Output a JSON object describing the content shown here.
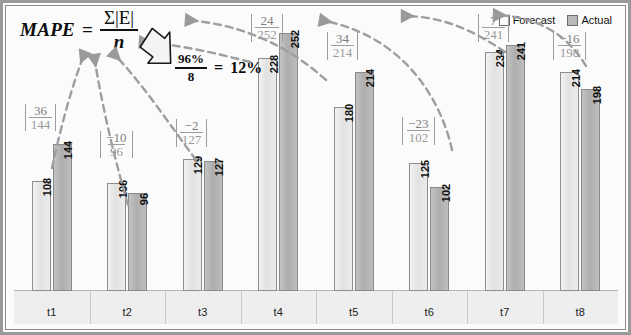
{
  "formula": {
    "name": "MAPE",
    "equals": "=",
    "numerator": "Σ|E|",
    "denominator": "n",
    "result_numerator": "96%",
    "result_denominator": "8",
    "result_equals": "=",
    "result_value": "12%"
  },
  "legend": {
    "items": [
      {
        "label": "Forecast",
        "swatch": "forecast-swatch",
        "color": "#fdfdfd"
      },
      {
        "label": "Actual",
        "swatch": "actual-swatch",
        "color": "#b9b9b9"
      }
    ]
  },
  "chart_data": {
    "type": "bar",
    "title": "",
    "xlabel": "",
    "ylabel": "",
    "ylim": [
      0,
      265
    ],
    "grid": false,
    "legend_position": "top-right",
    "categories": [
      "t1",
      "t2",
      "t3",
      "t4",
      "t5",
      "t6",
      "t7",
      "t8"
    ],
    "series": [
      {
        "name": "Forecast",
        "values": [
          108,
          106,
          129,
          228,
          180,
          125,
          234,
          214
        ]
      },
      {
        "name": "Actual",
        "values": [
          144,
          96,
          127,
          252,
          214,
          102,
          241,
          198
        ]
      }
    ],
    "annotations": [
      {
        "category": "t1",
        "error": "36",
        "base": "144"
      },
      {
        "category": "t2",
        "error": "−10",
        "base": "96"
      },
      {
        "category": "t3",
        "error": "−2",
        "base": "127"
      },
      {
        "category": "t4",
        "error": "24",
        "base": "252"
      },
      {
        "category": "t5",
        "error": "34",
        "base": "214"
      },
      {
        "category": "t6",
        "error": "−23",
        "base": "102"
      },
      {
        "category": "t7",
        "error": "7",
        "base": "241"
      },
      {
        "category": "t8",
        "error": "−16",
        "base": "198"
      }
    ]
  }
}
